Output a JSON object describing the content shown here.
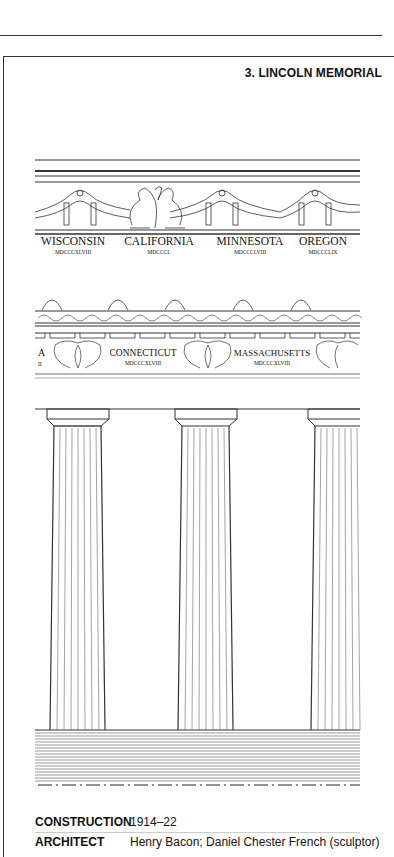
{
  "header": {
    "title": "3. LINCOLN MEMORIAL"
  },
  "frieze_upper": {
    "states": [
      {
        "name": "WISCONSIN",
        "year": "MDCCCXLVIII"
      },
      {
        "name": "CALIFORNIA",
        "year": "MDCCCL"
      },
      {
        "name": "MINNESOTA",
        "year": "MDCCCLVIII"
      },
      {
        "name": "OREGON",
        "year": "MDCCCLIX"
      }
    ]
  },
  "frieze_lower": {
    "partial_left": {
      "name": "A",
      "year": "II"
    },
    "states": [
      {
        "name": "CONNECTICUT",
        "year": "MDCCCXLVIII"
      },
      {
        "name": "MASSACHUSETTS",
        "year": "MDCCCXLVIII"
      }
    ]
  },
  "details": {
    "construction_label": "CONSTRUCTION",
    "construction_value": "1914–22",
    "architect_label": "ARCHITECT",
    "architect_value": "Henry Bacon; Daniel Chester French (sculptor)"
  }
}
